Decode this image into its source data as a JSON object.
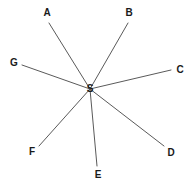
{
  "diagram": {
    "type": "star-graph",
    "width": 193,
    "height": 186,
    "background_color": "#ffffff",
    "edge_color": "#5a5a5a",
    "edge_width": 1,
    "label_color": "#1a1a1a",
    "center": {
      "id": "S",
      "label": "S",
      "x": 90,
      "y": 89
    },
    "nodes": [
      {
        "id": "A",
        "label": "A",
        "x": 47,
        "y": 13,
        "edge_x": 49,
        "edge_y": 23
      },
      {
        "id": "B",
        "label": "B",
        "x": 129,
        "y": 13,
        "edge_x": 128,
        "edge_y": 23
      },
      {
        "id": "C",
        "label": "C",
        "x": 180,
        "y": 70,
        "edge_x": 171,
        "edge_y": 70
      },
      {
        "id": "D",
        "label": "D",
        "x": 171,
        "y": 153,
        "edge_x": 164,
        "edge_y": 146
      },
      {
        "id": "E",
        "label": "E",
        "x": 98,
        "y": 175,
        "edge_x": 97,
        "edge_y": 166
      },
      {
        "id": "F",
        "label": "F",
        "x": 32,
        "y": 152,
        "edge_x": 39,
        "edge_y": 146
      },
      {
        "id": "G",
        "label": "G",
        "x": 14,
        "y": 63,
        "edge_x": 22,
        "edge_y": 65
      }
    ],
    "edges": [
      {
        "from": "S",
        "to": "A"
      },
      {
        "from": "S",
        "to": "B"
      },
      {
        "from": "S",
        "to": "C"
      },
      {
        "from": "S",
        "to": "D"
      },
      {
        "from": "S",
        "to": "E"
      },
      {
        "from": "S",
        "to": "F"
      },
      {
        "from": "S",
        "to": "G"
      }
    ]
  }
}
